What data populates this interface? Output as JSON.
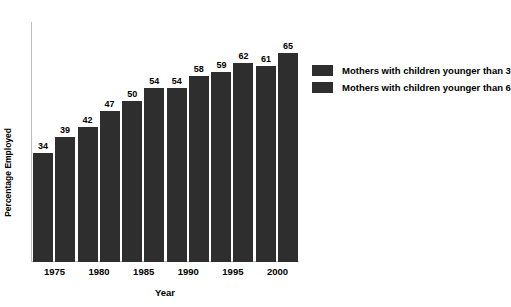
{
  "chart_data": {
    "type": "bar",
    "title": "",
    "xlabel": "Year",
    "ylabel": "Percentage Employed",
    "categories": [
      "1975",
      "1980",
      "1985",
      "1990",
      "1995",
      "2000"
    ],
    "series": [
      {
        "name": "Mothers with children younger than 3",
        "color": "#2e2e2e",
        "values": [
          34,
          42,
          50,
          54,
          59,
          61
        ]
      },
      {
        "name": "Mothers with children younger than 6",
        "color": "#2e2e2e",
        "values": [
          39,
          47,
          54,
          58,
          62,
          65
        ]
      }
    ],
    "ylim": [
      0,
      79
    ],
    "grid": false,
    "legend_position": "right",
    "value_labels": true
  },
  "legend": {
    "items": [
      {
        "label": "Mothers with children younger than 3",
        "color": "#2e2e2e"
      },
      {
        "label": "Mothers with children younger than 6",
        "color": "#2e2e2e"
      }
    ]
  },
  "axes": {
    "x_title": "Year",
    "y_title": "Percentage Employed"
  },
  "colors": {
    "background": "#ffffff",
    "bar": "#2e2e2e",
    "text": "#000000",
    "axis_line": "#bdbdbd"
  }
}
